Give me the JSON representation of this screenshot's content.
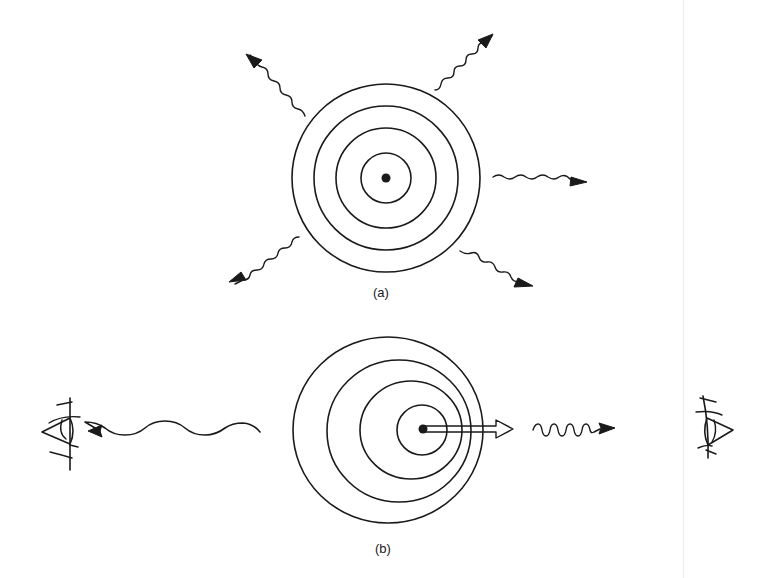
{
  "figure": {
    "panels": [
      {
        "id": "a",
        "label": "(a)",
        "description": "Stationary source emitting spherical wavefronts equally in all directions",
        "source": {
          "cx": 386,
          "cy": 178
        },
        "wavefront_radii": [
          25,
          50,
          72,
          94
        ],
        "emitted_waves": [
          "upper-left",
          "upper-right",
          "right",
          "lower-left",
          "lower-right"
        ]
      },
      {
        "id": "b",
        "label": "(b)",
        "description": "Moving source: wavefronts compressed ahead (short wavelength) and stretched behind (long wavelength)",
        "motion_arrow": "source-velocity-arrow pointing right",
        "wave_toward_left_observer": "long wavelength",
        "wave_toward_right_observer": "short wavelength",
        "observers": [
          "left-eye",
          "right-eye"
        ]
      }
    ],
    "colors": {
      "ink": "#1a1a1a",
      "background": "#ffffff",
      "edge_line": "#ececec"
    }
  }
}
